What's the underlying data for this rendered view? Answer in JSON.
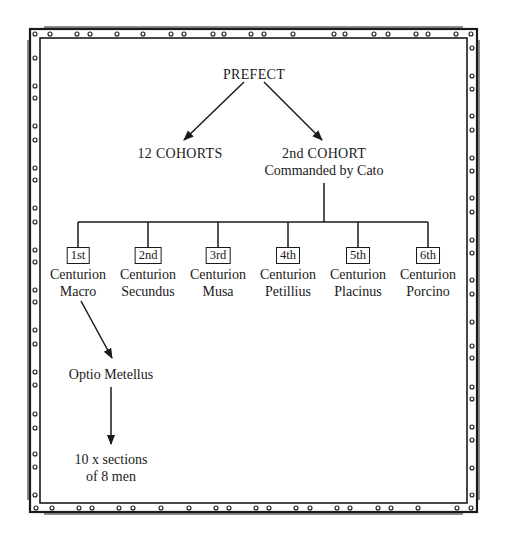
{
  "diagram": {
    "type": "org-chart",
    "root": {
      "label": "PREFECT"
    },
    "level1": [
      {
        "label": "12 COHORTS"
      },
      {
        "line1": "2nd COHORT",
        "line2": "Commanded by Cato"
      }
    ],
    "centurions": [
      {
        "rank": "1st",
        "title": "Centurion",
        "name": "Macro"
      },
      {
        "rank": "2nd",
        "title": "Centurion",
        "name": "Secundus"
      },
      {
        "rank": "3rd",
        "title": "Centurion",
        "name": "Musa"
      },
      {
        "rank": "4th",
        "title": "Centurion",
        "name": "Petillius"
      },
      {
        "rank": "5th",
        "title": "Centurion",
        "name": "Placinus"
      },
      {
        "rank": "6th",
        "title": "Centurion",
        "name": "Porcino"
      }
    ],
    "optio": {
      "label": "Optio Metellus"
    },
    "sections": {
      "line1": "10 x sections",
      "line2": "of 8 men"
    }
  },
  "colors": {
    "ink": "#1a1a1a",
    "background": "#ffffff"
  }
}
